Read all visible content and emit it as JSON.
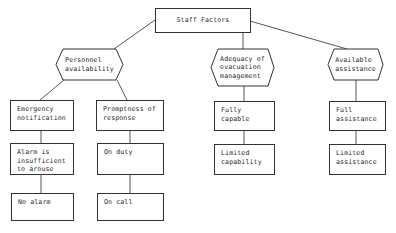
{
  "diagram": {
    "root": {
      "lines": [
        "Staff Factors"
      ]
    },
    "categories": [
      {
        "id": "personnel",
        "lines": [
          "Personnel",
          "availability"
        ],
        "children": [
          {
            "id": "emergency",
            "lines": [
              "Emergency",
              "notification"
            ],
            "children": [
              {
                "lines": [
                  "Alarm is",
                  "insufficient",
                  "to arouse"
                ]
              },
              {
                "lines": [
                  "No alarm"
                ]
              }
            ]
          },
          {
            "id": "promptness",
            "lines": [
              "Promptness of",
              "response"
            ],
            "children": [
              {
                "lines": [
                  "On duty"
                ]
              },
              {
                "lines": [
                  "On call"
                ]
              }
            ]
          }
        ]
      },
      {
        "id": "adequacy",
        "lines": [
          "Adequacy of",
          "evacuation",
          "management"
        ],
        "children": [
          {
            "lines": [
              "Fully",
              "capable"
            ]
          },
          {
            "lines": [
              "Limited",
              "capability"
            ]
          }
        ]
      },
      {
        "id": "assistance",
        "lines": [
          "Available",
          "assistance"
        ],
        "children": [
          {
            "lines": [
              "Full",
              "assistance"
            ]
          },
          {
            "lines": [
              "Limited",
              "assistance"
            ]
          }
        ]
      }
    ]
  },
  "colors": {
    "line": "#333333",
    "text": "#2a2a2a",
    "background": "#ffffff"
  }
}
